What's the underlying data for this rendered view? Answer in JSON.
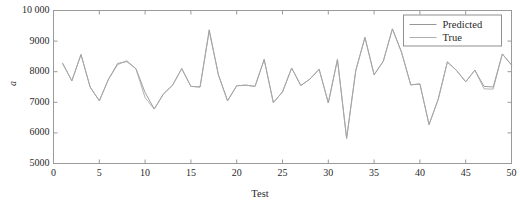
{
  "chart_data": {
    "type": "line",
    "title": "",
    "xlabel": "Test",
    "ylabel": "a",
    "xlim": [
      0,
      50
    ],
    "ylim": [
      5000,
      10000
    ],
    "xticks": [
      0,
      5,
      10,
      15,
      20,
      25,
      30,
      35,
      40,
      45,
      50
    ],
    "xtick_labels": [
      "0",
      "5",
      "10",
      "15",
      "20",
      "25",
      "30",
      "35",
      "40",
      "45",
      "50"
    ],
    "yticks": [
      5000,
      6000,
      7000,
      8000,
      9000,
      10000
    ],
    "ytick_labels": [
      "5000",
      "6000",
      "7000",
      "8000",
      "9000",
      "10 000"
    ],
    "grid": false,
    "legend_position": "upper right",
    "x": [
      1,
      2,
      3,
      4,
      5,
      6,
      7,
      8,
      9,
      10,
      11,
      12,
      13,
      14,
      15,
      16,
      17,
      18,
      19,
      20,
      21,
      22,
      23,
      24,
      25,
      26,
      27,
      28,
      29,
      30,
      31,
      32,
      33,
      34,
      35,
      36,
      37,
      38,
      39,
      40,
      41,
      42,
      43,
      44,
      45,
      46,
      47,
      48,
      49,
      50
    ],
    "series": [
      {
        "name": "Predicted",
        "color": "#8c8c8c",
        "values": [
          8270,
          7700,
          8560,
          7500,
          7050,
          7750,
          8270,
          8330,
          8100,
          7320,
          6780,
          7270,
          7560,
          8100,
          7520,
          7500,
          9370,
          7900,
          7050,
          7540,
          7560,
          7520,
          8400,
          6990,
          7340,
          8120,
          7550,
          7760,
          8080,
          6980,
          8400,
          5820,
          8040,
          9120,
          7900,
          8340,
          9400,
          8630,
          7570,
          7600,
          6270,
          7100,
          8320,
          8040,
          7670,
          8050,
          7520,
          7500,
          8580,
          8220
        ]
      },
      {
        "name": "True",
        "color": "#a6a6a6",
        "values": [
          8270,
          7700,
          8560,
          7500,
          7050,
          7750,
          8230,
          8360,
          8090,
          7150,
          6780,
          7270,
          7560,
          8100,
          7520,
          7500,
          9320,
          7900,
          7050,
          7540,
          7560,
          7520,
          8400,
          6990,
          7340,
          8120,
          7550,
          7760,
          8080,
          6980,
          8400,
          5820,
          8040,
          9120,
          7900,
          8340,
          9400,
          8630,
          7570,
          7600,
          6270,
          7100,
          8320,
          8040,
          7670,
          8050,
          7440,
          7430,
          8580,
          8220
        ]
      }
    ]
  },
  "legend": {
    "items": [
      {
        "label": "Predicted"
      },
      {
        "label": "True"
      }
    ]
  }
}
